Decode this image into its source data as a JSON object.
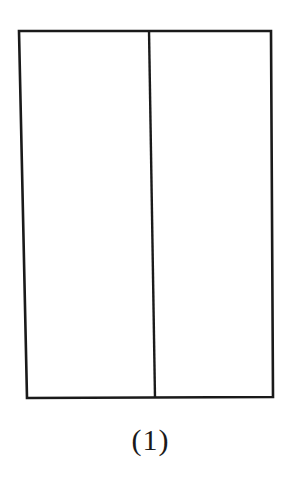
{
  "figure": {
    "caption": "(1)",
    "stroke_color": "#1a1a1a",
    "background": "#ffffff"
  },
  "diagram": {
    "shape": "rectangle divided by one vertical line into two panels",
    "outer_rectangle": {
      "top_left": [
        19,
        31
      ],
      "top_right": [
        271,
        31
      ],
      "bottom_right": [
        273,
        397
      ],
      "bottom_left": [
        27,
        398
      ]
    },
    "divider": {
      "top": [
        149,
        30
      ],
      "bottom": [
        155,
        398
      ]
    },
    "panels": [
      {
        "name": "left-panel"
      },
      {
        "name": "right-panel"
      }
    ]
  }
}
